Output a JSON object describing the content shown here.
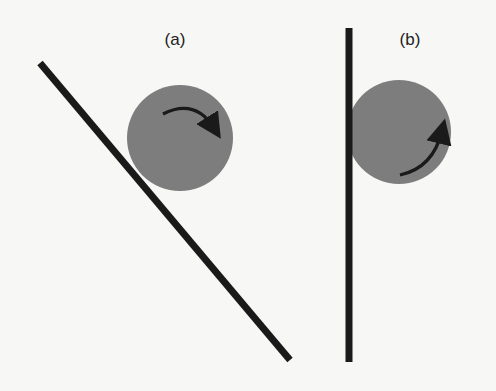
{
  "figure": {
    "panels": [
      {
        "id": "a",
        "label": "(a)",
        "label_pos": [
          175,
          30
        ],
        "wall": {
          "orientation": "inclined",
          "x1": 40,
          "y1": 63,
          "x2": 290,
          "y2": 360
        },
        "ball": {
          "cx": 180,
          "cy": 138,
          "r": 53,
          "color": "#7d7d7d"
        },
        "rotation_arrow": {
          "direction": "clockwise"
        }
      },
      {
        "id": "b",
        "label": "(b)",
        "label_pos": [
          410,
          30
        ],
        "wall": {
          "orientation": "vertical",
          "x1": 349,
          "y1": 28,
          "x2": 349,
          "y2": 362
        },
        "ball": {
          "cx": 399,
          "cy": 132,
          "r": 52,
          "color": "#7d7d7d"
        },
        "rotation_arrow": {
          "direction": "counterclockwise"
        }
      }
    ],
    "colors": {
      "line": "#1a1a1a",
      "ball": "#7d7d7d",
      "arrow": "#1a1a1a",
      "background": "#f7f7f5"
    }
  }
}
